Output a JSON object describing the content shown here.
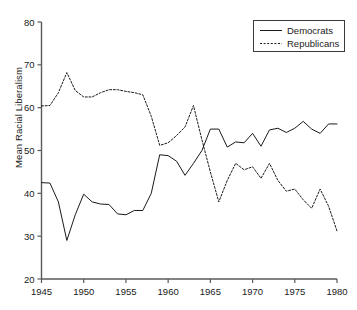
{
  "chart_data": {
    "type": "line",
    "title": "",
    "xlabel": "",
    "ylabel": "Mean Racial Liberalism",
    "xlim": [
      1945,
      1980
    ],
    "ylim": [
      20,
      80
    ],
    "xticks": [
      1945,
      1950,
      1955,
      1960,
      1965,
      1970,
      1975,
      1980
    ],
    "yticks": [
      20,
      30,
      40,
      50,
      60,
      70,
      80
    ],
    "grid": false,
    "legend_position": "top-right",
    "x": [
      1945,
      1946,
      1947,
      1948,
      1949,
      1950,
      1951,
      1952,
      1953,
      1954,
      1955,
      1956,
      1957,
      1958,
      1959,
      1960,
      1961,
      1962,
      1963,
      1964,
      1965,
      1966,
      1967,
      1968,
      1969,
      1970,
      1971,
      1972,
      1973,
      1974,
      1975,
      1976,
      1977,
      1978,
      1979,
      1980
    ],
    "series": [
      {
        "name": "Democrats",
        "style": "solid",
        "color": "#1a1a1a",
        "values": [
          42.5,
          42.4,
          38.0,
          29.0,
          35.0,
          39.8,
          38.0,
          37.5,
          37.4,
          35.2,
          35.0,
          36.0,
          36.0,
          40.0,
          49.0,
          48.8,
          47.5,
          44.2,
          47.0,
          50.0,
          55.0,
          55.0,
          50.8,
          52.0,
          51.8,
          54.0,
          51.0,
          54.8,
          55.2,
          54.2,
          55.2,
          56.8,
          55.0,
          54.0,
          56.2,
          56.2
        ]
      },
      {
        "name": "Republicans",
        "style": "dotted",
        "color": "#1a1a1a",
        "values": [
          60.4,
          60.5,
          63.5,
          68.2,
          64.0,
          62.5,
          62.5,
          63.5,
          64.2,
          64.2,
          63.8,
          63.5,
          63.0,
          58.0,
          51.2,
          51.8,
          53.5,
          55.5,
          60.5,
          52.5,
          45.0,
          38.0,
          43.0,
          47.0,
          45.5,
          46.2,
          43.5,
          47.0,
          43.0,
          40.5,
          41.0,
          38.5,
          36.5,
          41.0,
          37.0,
          31.2
        ]
      }
    ]
  },
  "legend": {
    "items": [
      {
        "label": "Democrats",
        "key": "solid-line-key"
      },
      {
        "label": "Republicans",
        "key": "dotted-line-key"
      }
    ]
  },
  "axes": {
    "y_axis_title": "Mean Racial Liberalism",
    "y_tick_labels": [
      "20",
      "30",
      "40",
      "50",
      "60",
      "70",
      "80"
    ],
    "x_tick_labels": [
      "1945",
      "1950",
      "1955",
      "1960",
      "1965",
      "1970",
      "1975",
      "1980"
    ]
  }
}
